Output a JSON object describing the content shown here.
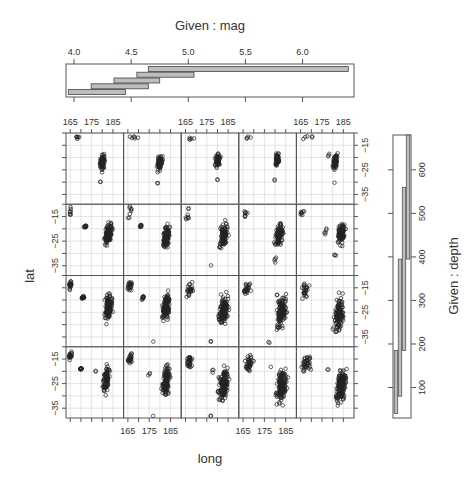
{
  "chart_data": {
    "type": "scatter",
    "plot_kind": "coplot",
    "title": "",
    "xlabel": "long",
    "ylabel": "lat",
    "x_ticks": [
      165,
      175,
      185
    ],
    "y_ticks": [
      -15,
      -25,
      -35
    ],
    "xlim": [
      163,
      190
    ],
    "ylim": [
      -39,
      -10
    ],
    "grid": true,
    "layout": {
      "columns": 5,
      "rows": 4
    },
    "given_mag": {
      "label": "Given : mag",
      "ticks": [
        4.0,
        4.5,
        5.0,
        5.5,
        6.0
      ],
      "range": [
        3.93,
        6.45
      ],
      "intervals": [
        [
          3.95,
          4.45
        ],
        [
          4.15,
          4.65
        ],
        [
          4.35,
          4.75
        ],
        [
          4.55,
          5.05
        ],
        [
          4.65,
          6.4
        ]
      ]
    },
    "given_depth": {
      "label": "Given : depth",
      "ticks": [
        100,
        200,
        300,
        400,
        500,
        600
      ],
      "range": [
        30,
        680
      ],
      "intervals": [
        [
          40,
          185
        ],
        [
          80,
          395
        ],
        [
          185,
          560
        ],
        [
          395,
          680
        ]
      ]
    },
    "panel_clusters_note": "Each of 20 panels shows earthquake lat/long points for one depth×mag interval combination",
    "panels": [
      {
        "row": 0,
        "col": 0,
        "clusters": [
          [
            168,
            -12,
            4,
            1.5,
            6
          ],
          [
            180,
            -22,
            2,
            6,
            70
          ],
          [
            179,
            -30,
            0.5,
            1,
            2
          ]
        ]
      },
      {
        "row": 0,
        "col": 1,
        "clusters": [
          [
            168,
            -12,
            4,
            1.5,
            6
          ],
          [
            180,
            -22,
            2,
            6,
            70
          ],
          [
            179,
            -30,
            0.5,
            1,
            2
          ]
        ]
      },
      {
        "row": 0,
        "col": 2,
        "clusters": [
          [
            168,
            -12,
            3,
            1.5,
            5
          ],
          [
            180,
            -21,
            2,
            5,
            55
          ],
          [
            180,
            -29,
            0.5,
            1,
            2
          ]
        ]
      },
      {
        "row": 0,
        "col": 3,
        "clusters": [
          [
            168,
            -12,
            3,
            1.5,
            4
          ],
          [
            181,
            -21,
            1.5,
            5,
            60
          ],
          [
            180,
            -29,
            0.5,
            1,
            2
          ]
        ]
      },
      {
        "row": 0,
        "col": 4,
        "clusters": [
          [
            168,
            -12,
            4,
            1.5,
            5
          ],
          [
            178,
            -19,
            3,
            2,
            3
          ],
          [
            181,
            -22,
            2,
            6,
            65
          ],
          [
            181,
            -30,
            0.5,
            1,
            1
          ]
        ]
      },
      {
        "row": 1,
        "col": 0,
        "clusters": [
          [
            165,
            -13,
            1,
            3,
            8
          ],
          [
            172,
            -19,
            1,
            1,
            10
          ],
          [
            183,
            -22,
            3,
            8,
            110
          ]
        ]
      },
      {
        "row": 1,
        "col": 1,
        "clusters": [
          [
            166,
            -13,
            1.5,
            4,
            8
          ],
          [
            171,
            -19,
            1,
            1,
            8
          ],
          [
            183,
            -23,
            3,
            9,
            110
          ]
        ]
      },
      {
        "row": 1,
        "col": 2,
        "clusters": [
          [
            166,
            -14,
            2,
            5,
            8
          ],
          [
            183,
            -23,
            3,
            10,
            110
          ],
          [
            177,
            -35,
            0.5,
            0.5,
            1
          ]
        ]
      },
      {
        "row": 1,
        "col": 3,
        "clusters": [
          [
            166,
            -14,
            2,
            4,
            8
          ],
          [
            182,
            -22,
            3,
            8,
            100
          ],
          [
            180,
            -33,
            1,
            3,
            4
          ]
        ]
      },
      {
        "row": 1,
        "col": 4,
        "clusters": [
          [
            166,
            -13,
            2,
            3,
            8
          ],
          [
            177,
            -21,
            2,
            3,
            5
          ],
          [
            184,
            -22,
            3,
            8,
            100
          ],
          [
            181,
            -31,
            1,
            2,
            3
          ]
        ]
      },
      {
        "row": 2,
        "col": 0,
        "clusters": [
          [
            165,
            -14,
            1,
            3,
            20
          ],
          [
            171,
            -19,
            1,
            1,
            20
          ],
          [
            183,
            -23,
            3,
            10,
            130
          ],
          [
            181,
            -20,
            1,
            1,
            1
          ]
        ]
      },
      {
        "row": 2,
        "col": 1,
        "clusters": [
          [
            166,
            -14,
            2,
            4,
            20
          ],
          [
            172,
            -19,
            1,
            2,
            10
          ],
          [
            183,
            -23,
            3,
            10,
            130
          ],
          [
            177,
            -37,
            0.5,
            0.5,
            1
          ]
        ]
      },
      {
        "row": 2,
        "col": 2,
        "clusters": [
          [
            167,
            -16,
            3,
            6,
            25
          ],
          [
            181,
            -18,
            1,
            1,
            1
          ],
          [
            183,
            -24,
            4,
            11,
            120
          ],
          [
            177,
            -37,
            0.5,
            1,
            2
          ]
        ]
      },
      {
        "row": 2,
        "col": 3,
        "clusters": [
          [
            167,
            -16,
            3,
            6,
            25
          ],
          [
            181,
            -18,
            1,
            1,
            1
          ],
          [
            183,
            -25,
            4,
            12,
            120
          ],
          [
            177,
            -37,
            1,
            1,
            2
          ]
        ]
      },
      {
        "row": 2,
        "col": 4,
        "clusters": [
          [
            167,
            -16,
            3,
            6,
            25
          ],
          [
            183,
            -26,
            4,
            12,
            120
          ]
        ]
      },
      {
        "row": 3,
        "col": 0,
        "clusters": [
          [
            165,
            -14,
            1,
            3,
            20
          ],
          [
            170,
            -19,
            1,
            1,
            12
          ],
          [
            182,
            -23,
            3,
            10,
            80
          ],
          [
            177,
            -20,
            1,
            1,
            2
          ]
        ]
      },
      {
        "row": 3,
        "col": 1,
        "clusters": [
          [
            166,
            -15,
            2,
            5,
            25
          ],
          [
            175,
            -21,
            3,
            2,
            3
          ],
          [
            183,
            -24,
            3,
            11,
            120
          ],
          [
            177,
            -38,
            0.5,
            0.5,
            1
          ]
        ]
      },
      {
        "row": 3,
        "col": 2,
        "clusters": [
          [
            167,
            -16,
            3,
            6,
            30
          ],
          [
            178,
            -20,
            2,
            2,
            3
          ],
          [
            183,
            -25,
            4,
            12,
            130
          ],
          [
            177,
            -38,
            0.5,
            0.5,
            2
          ]
        ]
      },
      {
        "row": 3,
        "col": 3,
        "clusters": [
          [
            168,
            -17,
            4,
            6,
            40
          ],
          [
            183,
            -26,
            4,
            12,
            150
          ],
          [
            178,
            -18,
            1,
            1,
            1
          ]
        ]
      },
      {
        "row": 3,
        "col": 4,
        "clusters": [
          [
            168,
            -17,
            4,
            6,
            40
          ],
          [
            184,
            -26,
            4,
            12,
            170
          ],
          [
            178,
            -19,
            1,
            1,
            2
          ]
        ]
      }
    ]
  },
  "labels": {
    "mag_title": "Given : mag",
    "depth_title": "Given : depth",
    "xlabel": "long",
    "ylabel": "lat"
  }
}
